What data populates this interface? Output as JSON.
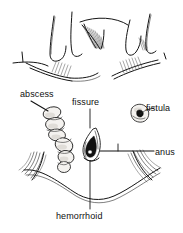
{
  "figure": {
    "type": "medical-line-illustration",
    "background_color": "#ffffff",
    "ink_color": "#141414",
    "width": 183,
    "height": 233
  },
  "labels": {
    "abscess": "abscess",
    "fissure": "fissure",
    "fistula": "fistula",
    "anus": "anus",
    "hemorrhoid": "hemorrhoid"
  },
  "structures": [
    {
      "name": "abscess",
      "label": "abscess",
      "description": "chain of lumpy oval nodules descending diagonally",
      "leader": "diagonal from label down-right to upper nodule"
    },
    {
      "name": "fissure",
      "label": "fissure",
      "description": "dark teardrop flame-shaped cleft at midline",
      "leader": "vertical line from label down to lesion"
    },
    {
      "name": "fistula",
      "label": "fistula",
      "description": "small round lumpy ring with dark center",
      "leader": "short dash from ring right to label"
    },
    {
      "name": "anus",
      "label": "anus",
      "description": "central opening of the anal canal",
      "leader": "horizontal line from opening right to label"
    },
    {
      "name": "hemorrhoid",
      "label": "hemorrhoid",
      "description": "swollen vascular cushion at anal verge",
      "leader": "vertical line from lesion down to label"
    }
  ],
  "upper_panel": {
    "description": "cutaway anatomical sketch of anal canal folds and columns with hatched shading",
    "elements": [
      "mucosal column left",
      "mucosal column center",
      "fold arch",
      "mucosal column right",
      "hatched crypt shading"
    ]
  },
  "lower_panel": {
    "description": "external view of anal verge with radiating striated perianal skin folds forming a wide arch"
  }
}
